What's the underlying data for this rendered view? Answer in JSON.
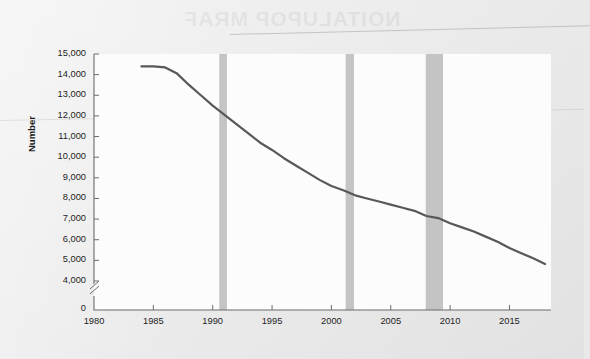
{
  "figure": {
    "background_color": "#ececec",
    "plot_background_color": "#fcfcfc",
    "axis_color": "#6b6b6b",
    "ghost_text": "NOITALUPOP MRAF"
  },
  "chart_data": {
    "type": "line",
    "title": "",
    "subtitle": "",
    "xlabel": "",
    "ylabel": "Number",
    "grid": false,
    "legend": null,
    "xlim": [
      1980,
      2018.5
    ],
    "ylim": [
      3500,
      15000
    ],
    "y_axis_break": true,
    "y_axis_break_label": "0",
    "xticks": [
      1980,
      1985,
      1990,
      1995,
      2000,
      2005,
      2010,
      2015
    ],
    "xticklabels": [
      "1980",
      "1985",
      "1990",
      "1995",
      "2000",
      "2005",
      "2010",
      "2015"
    ],
    "yticks": [
      4000,
      5000,
      6000,
      7000,
      8000,
      9000,
      10000,
      11000,
      12000,
      13000,
      14000,
      15000
    ],
    "yticklabels": [
      "4,000",
      "5,000",
      "6,000",
      "7,000",
      "8,000",
      "9,000",
      "10,000",
      "11,000",
      "12,000",
      "13,000",
      "14,000",
      "15,000"
    ],
    "zero_tick_label": "0",
    "series": [
      {
        "name": "Number",
        "color": "#585858",
        "line_width": 2.2,
        "x": [
          1984,
          1985,
          1986,
          1987,
          1988,
          1989,
          1990,
          1991,
          1992,
          1993,
          1994,
          1995,
          1996,
          1997,
          1998,
          1999,
          2000,
          2001,
          2002,
          2003,
          2004,
          2005,
          2006,
          2007,
          2008,
          2009,
          2010,
          2011,
          2012,
          2013,
          2014,
          2015,
          2016,
          2017,
          2018
        ],
        "values": [
          14400,
          14400,
          14350,
          14050,
          13500,
          13000,
          12500,
          12050,
          11600,
          11150,
          10700,
          10350,
          9950,
          9600,
          9250,
          8900,
          8600,
          8400,
          8150,
          8000,
          7850,
          7700,
          7550,
          7400,
          7150,
          7050,
          6800,
          6600,
          6400,
          6150,
          5900,
          5600,
          5350,
          5100,
          4820
        ]
      }
    ],
    "shaded_regions": [
      {
        "name": "recession-1990",
        "start": 1990.55,
        "end": 1991.2,
        "color": "#c4c4c4"
      },
      {
        "name": "recession-2001",
        "start": 2001.2,
        "end": 2001.9,
        "color": "#c4c4c4"
      },
      {
        "name": "recession-2008",
        "start": 2007.95,
        "end": 2009.4,
        "color": "#c4c4c4"
      }
    ]
  }
}
